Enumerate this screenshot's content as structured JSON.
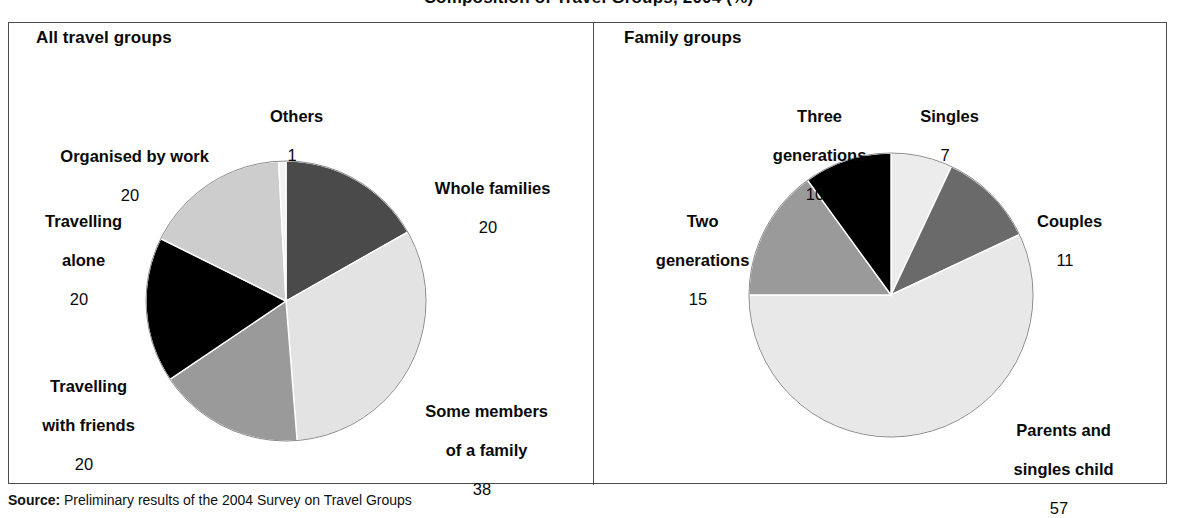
{
  "figure": {
    "title": "Composition of Travel Groups, 2004 (%)",
    "source_label": "Source:",
    "source_text": "Preliminary results of the 2004 Survey on Travel Groups"
  },
  "panels": [
    {
      "id": "all-travel-groups",
      "heading": "All travel groups"
    },
    {
      "id": "family-groups",
      "heading": "Family groups"
    }
  ],
  "chart_data": [
    {
      "type": "pie",
      "title": "All travel groups",
      "unit": "%",
      "categories": [
        "Whole families",
        "Some members of a family",
        "Travelling with friends",
        "Travelling alone",
        "Organised by work",
        "Others"
      ],
      "values": [
        20,
        38,
        20,
        20,
        20,
        1
      ],
      "labels": [
        {
          "name": "Whole families",
          "lines": [
            "Whole families"
          ],
          "value": "20",
          "color": "#4a4a4a"
        },
        {
          "name": "Some members of a family",
          "lines": [
            "Some members",
            "of a family"
          ],
          "value": "38",
          "color": "#e3e3e3"
        },
        {
          "name": "Travelling with friends",
          "lines": [
            "Travelling",
            "with friends"
          ],
          "value": "20",
          "color": "#9a9a9a"
        },
        {
          "name": "Travelling alone",
          "lines": [
            "Travelling",
            "alone"
          ],
          "value": "20",
          "color": "#000000"
        },
        {
          "name": "Organised by work",
          "lines": [
            "Organised by work"
          ],
          "value": "20",
          "color": "#cdcdcd"
        },
        {
          "name": "Others",
          "lines": [
            "Others"
          ],
          "value": "1",
          "color": "#f2f2f2"
        }
      ],
      "legend": "none",
      "start_angle_deg": 0,
      "direction": "clockwise"
    },
    {
      "type": "pie",
      "title": "Family groups",
      "unit": "%",
      "categories": [
        "Singles",
        "Couples",
        "Parents and singles child",
        "Two generations",
        "Three generations"
      ],
      "values": [
        7,
        11,
        57,
        15,
        10
      ],
      "labels": [
        {
          "name": "Singles",
          "lines": [
            "Singles"
          ],
          "value": "7",
          "color": "#ececec"
        },
        {
          "name": "Couples",
          "lines": [
            "Couples"
          ],
          "value": "11",
          "color": "#6a6a6a"
        },
        {
          "name": "Parents and singles child",
          "lines": [
            "Parents and",
            "singles child"
          ],
          "value": "57",
          "color": "#e8e8e8"
        },
        {
          "name": "Two generations",
          "lines": [
            "Two",
            "generations"
          ],
          "value": "15",
          "color": "#9a9a9a"
        },
        {
          "name": "Three generations",
          "lines": [
            "Three",
            "generations"
          ],
          "value": "10",
          "color": "#000000"
        }
      ],
      "legend": "none",
      "start_angle_deg": 0,
      "direction": "clockwise"
    }
  ]
}
